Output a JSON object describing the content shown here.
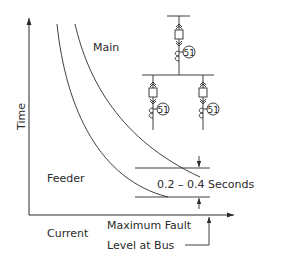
{
  "axes": {
    "y_label": "Time",
    "x_label": "Current"
  },
  "curves": {
    "main_label": "Main",
    "feeder_label": "Feeder"
  },
  "annotations": {
    "interval": "0.2  –  0.4  Seconds",
    "fault_line1": "Maximum Fault",
    "fault_line2": "Level at Bus"
  },
  "one_line": {
    "relay_code": "51"
  },
  "colors": {
    "line": "#2a2a2a",
    "background": "#ffffff"
  }
}
